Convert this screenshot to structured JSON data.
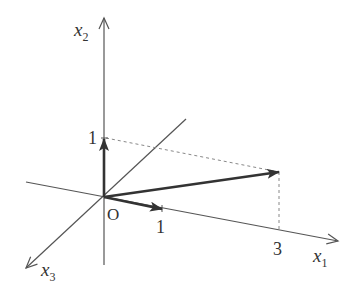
{
  "diagram": {
    "type": "3d-coordinate-axes-with-vectors",
    "colors": {
      "axis": "#555555",
      "vector": "#333333",
      "dashed": "#888888",
      "text": "#333333"
    },
    "axes": {
      "x1": {
        "label": "x",
        "subscript": "1"
      },
      "x2": {
        "label": "x",
        "subscript": "2"
      },
      "x3": {
        "label": "x",
        "subscript": "3"
      }
    },
    "origin_label": "O",
    "ticks": {
      "x1_unit": "1",
      "x1_three": "3",
      "x2_unit": "1"
    },
    "vectors": [
      {
        "name": "e2",
        "components": [
          0,
          1,
          0
        ]
      },
      {
        "name": "e1",
        "components": [
          1,
          0,
          0
        ]
      },
      {
        "name": "v",
        "components": [
          3,
          1,
          0
        ]
      }
    ]
  }
}
